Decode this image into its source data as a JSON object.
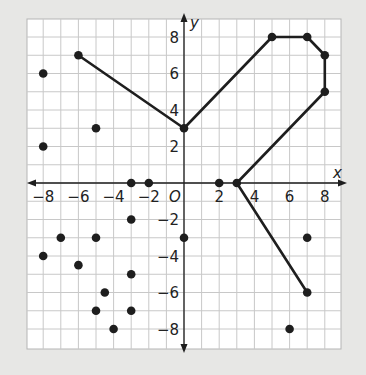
{
  "chart_data": {
    "type": "scatter",
    "title": "",
    "xlabel": "x",
    "ylabel": "y",
    "origin_label": "O",
    "xlim": [
      -9,
      9
    ],
    "ylim": [
      -9,
      9
    ],
    "grid": true,
    "grid_step": 1,
    "x_ticks": [
      -8,
      -6,
      -4,
      -2,
      2,
      4,
      6,
      8
    ],
    "y_ticks": [
      -8,
      -6,
      -4,
      -2,
      2,
      4,
      6,
      8
    ],
    "x_tick_labels": [
      "−8",
      "−6",
      "−4",
      "−2",
      "2",
      "4",
      "6",
      "8"
    ],
    "y_tick_labels": [
      "−8",
      "−6",
      "−4",
      "−2",
      "2",
      "4",
      "6",
      "8"
    ],
    "points": [
      {
        "x": -8,
        "y": 6
      },
      {
        "x": -8,
        "y": 2
      },
      {
        "x": -5,
        "y": 3
      },
      {
        "x": -6,
        "y": 7
      },
      {
        "x": 0,
        "y": 3
      },
      {
        "x": 5,
        "y": 8
      },
      {
        "x": 7,
        "y": 8
      },
      {
        "x": 8,
        "y": 7
      },
      {
        "x": 8,
        "y": 5
      },
      {
        "x": -3,
        "y": 0
      },
      {
        "x": -2,
        "y": 0
      },
      {
        "x": 2,
        "y": 0
      },
      {
        "x": 3,
        "y": 0
      },
      {
        "x": -3,
        "y": -2
      },
      {
        "x": -7,
        "y": -3
      },
      {
        "x": -5,
        "y": -3
      },
      {
        "x": 0,
        "y": -3
      },
      {
        "x": -8,
        "y": -4
      },
      {
        "x": -6,
        "y": -4.5
      },
      {
        "x": -3,
        "y": -5
      },
      {
        "x": -4.5,
        "y": -6
      },
      {
        "x": -5,
        "y": -7
      },
      {
        "x": -3,
        "y": -7
      },
      {
        "x": -4,
        "y": -8
      },
      {
        "x": 7,
        "y": -3
      },
      {
        "x": 7,
        "y": -6
      },
      {
        "x": 6,
        "y": -8
      }
    ],
    "polyline": [
      {
        "x": -6,
        "y": 7
      },
      {
        "x": 0,
        "y": 3
      },
      {
        "x": 5,
        "y": 8
      },
      {
        "x": 7,
        "y": 8
      },
      {
        "x": 8,
        "y": 7
      },
      {
        "x": 8,
        "y": 5
      },
      {
        "x": 3,
        "y": 0
      },
      {
        "x": 7,
        "y": -6
      }
    ],
    "colors": {
      "background": "#e7e7e5",
      "plot_area": "#ffffff",
      "grid": "#c8c8c8",
      "ink": "#1e1e1e"
    }
  }
}
